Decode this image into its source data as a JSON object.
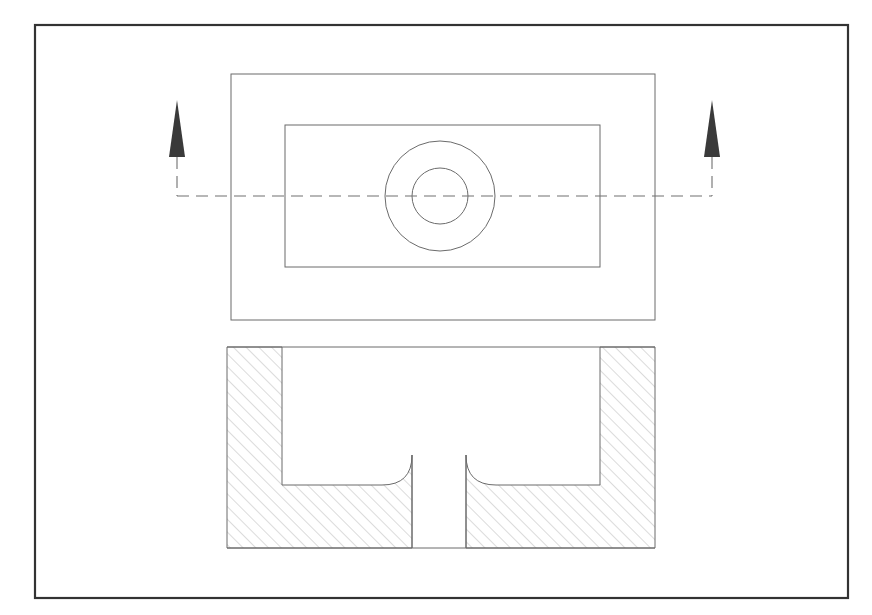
{
  "sheet": {
    "width": 872,
    "height": 615,
    "background_color": "#ffffff",
    "title": "Sectioned Counterbored Block — Top View and Section A-A"
  },
  "border": {
    "name": "sheet-border",
    "x": 35,
    "y": 25,
    "width": 813,
    "height": 573,
    "stroke_color": "#333333",
    "stroke_width": 2.2
  },
  "style": {
    "line_color": "#6b6b6b",
    "line_width": 1.0,
    "hatch_color": "#b0b0b0",
    "hatch_width": 0.9,
    "hatch_spacing": 9,
    "hatch_angle_deg": 45,
    "centerline_color": "#707070",
    "centerline_width": 1.1,
    "centerline_dash": "12 7",
    "arrow_fill": "#3a3a3a"
  },
  "top_view": {
    "name": "top-view",
    "outer_plate": {
      "name": "outer-plate-outline",
      "x": 231,
      "y": 74,
      "width": 424,
      "height": 246
    },
    "inner_pocket": {
      "name": "inner-pocket-outline",
      "x": 285,
      "y": 125,
      "width": 315,
      "height": 142
    },
    "outer_circle": {
      "name": "counterbore-circle",
      "cx": 440,
      "cy": 196,
      "r": 55
    },
    "inner_circle": {
      "name": "through-hole-circle",
      "cx": 440,
      "cy": 196,
      "r": 28
    }
  },
  "section_line": {
    "name": "section-cutting-line",
    "y": 196,
    "x_start": 177,
    "x_end": 712,
    "label": "A-A",
    "left_arrow": {
      "name": "section-arrow-left",
      "x": 177,
      "tip_y": 100,
      "base_y": 157,
      "half_width": 8,
      "direction": "up"
    },
    "right_arrow": {
      "name": "section-arrow-right",
      "x": 712,
      "tip_y": 100,
      "base_y": 157,
      "half_width": 8,
      "direction": "up"
    },
    "left_stem": {
      "x": 177,
      "y_top": 157,
      "y_bottom": 196
    },
    "right_stem": {
      "x": 712,
      "y_top": 157,
      "y_bottom": 196
    }
  },
  "section_view": {
    "name": "section-view",
    "body_left": 227,
    "body_right": 655,
    "body_top": 347,
    "body_bottom": 548,
    "wall_thickness_left": 55,
    "wall_thickness_right": 55,
    "cavity_left": 282,
    "cavity_right": 600,
    "cavity_floor_y": 485,
    "boss_top_y": 455,
    "hole_left": 412,
    "hole_right": 466,
    "fillet_radius": 30
  },
  "projection": {
    "scale_note": "first-angle orthographic projection",
    "views": [
      "top-view",
      "section-view"
    ]
  }
}
